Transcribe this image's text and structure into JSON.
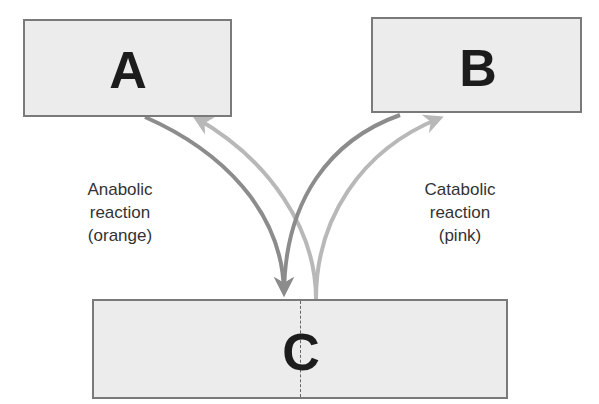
{
  "diagram": {
    "boxes": {
      "a": {
        "label": "A"
      },
      "b": {
        "label": "B"
      },
      "c": {
        "label": "C"
      }
    },
    "labels": {
      "anabolic": {
        "line1": "Anabolic",
        "line2": "reaction",
        "line3": "(orange)"
      },
      "catabolic": {
        "line1": "Catabolic",
        "line2": "reaction",
        "line3": "(pink)"
      }
    },
    "arrows": [
      {
        "from": "A",
        "to": "C",
        "type": "anabolic",
        "shade": "dark"
      },
      {
        "from": "B",
        "to": "C",
        "type": "anabolic",
        "shade": "dark"
      },
      {
        "from": "C",
        "to": "A",
        "type": "catabolic",
        "shade": "light"
      },
      {
        "from": "C",
        "to": "B",
        "type": "catabolic",
        "shade": "light"
      }
    ],
    "colors": {
      "box_fill": "#ececec",
      "box_border": "#7a7a7a",
      "anabolic_arrow": "#8c8c8c",
      "catabolic_arrow": "#b8b8b8",
      "text": "#333333"
    }
  }
}
